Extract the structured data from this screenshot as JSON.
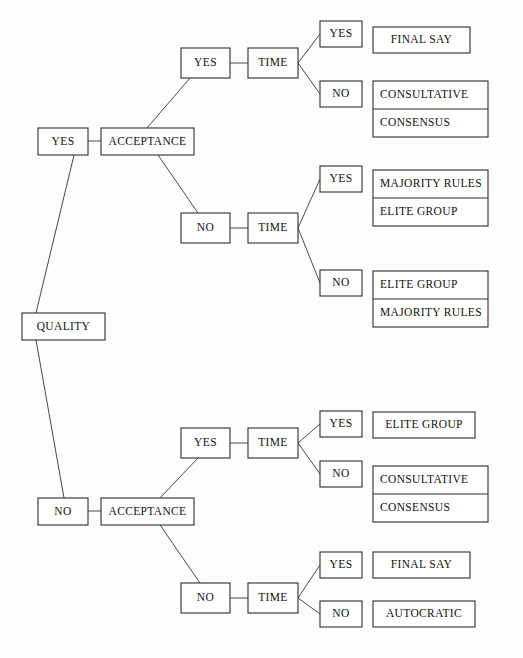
{
  "diagram": {
    "type": "decision-tree",
    "root": "QUALITY",
    "colors": {
      "background": "#fdfdfd",
      "box_stroke": "#2e2e2e",
      "edge_stroke": "#4a4a4a",
      "text": "#111111"
    }
  },
  "nodes": {
    "root": {
      "label": "QUALITY",
      "x": 22,
      "y": 313,
      "w": 83,
      "h": 27,
      "align": "center"
    },
    "q_yes": {
      "label": "YES",
      "x": 38,
      "y": 128,
      "w": 50,
      "h": 27,
      "align": "center"
    },
    "q_no": {
      "label": "NO",
      "x": 38,
      "y": 498,
      "w": 50,
      "h": 27,
      "align": "center"
    },
    "acc_top": {
      "label": "ACCEPTANCE",
      "x": 101,
      "y": 128,
      "w": 93,
      "h": 27,
      "align": "center"
    },
    "acc_bot": {
      "label": "ACCEPTANCE",
      "x": 101,
      "y": 498,
      "w": 93,
      "h": 27,
      "align": "center"
    },
    "acc_top_yes": {
      "label": "YES",
      "x": 181,
      "y": 48,
      "w": 49,
      "h": 30,
      "align": "center"
    },
    "acc_top_no": {
      "label": "NO",
      "x": 181,
      "y": 213,
      "w": 49,
      "h": 30,
      "align": "center"
    },
    "acc_bot_yes": {
      "label": "YES",
      "x": 181,
      "y": 428,
      "w": 49,
      "h": 30,
      "align": "center"
    },
    "acc_bot_no": {
      "label": "NO",
      "x": 181,
      "y": 583,
      "w": 49,
      "h": 30,
      "align": "center"
    },
    "time_1": {
      "label": "TIME",
      "x": 248,
      "y": 48,
      "w": 50,
      "h": 30,
      "align": "center"
    },
    "time_2": {
      "label": "TIME",
      "x": 248,
      "y": 213,
      "w": 50,
      "h": 30,
      "align": "center"
    },
    "time_3": {
      "label": "TIME",
      "x": 248,
      "y": 428,
      "w": 50,
      "h": 30,
      "align": "center"
    },
    "time_4": {
      "label": "TIME",
      "x": 248,
      "y": 583,
      "w": 50,
      "h": 30,
      "align": "center"
    },
    "t1_yes": {
      "label": "YES",
      "x": 320,
      "y": 21,
      "w": 42,
      "h": 26,
      "align": "center"
    },
    "t1_no": {
      "label": "NO",
      "x": 320,
      "y": 81,
      "w": 42,
      "h": 26,
      "align": "center"
    },
    "t2_yes": {
      "label": "YES",
      "x": 320,
      "y": 166,
      "w": 42,
      "h": 26,
      "align": "center"
    },
    "t2_no": {
      "label": "NO",
      "x": 320,
      "y": 270,
      "w": 42,
      "h": 26,
      "align": "center"
    },
    "t3_yes": {
      "label": "YES",
      "x": 320,
      "y": 411,
      "w": 42,
      "h": 26,
      "align": "center"
    },
    "t3_no": {
      "label": "NO",
      "x": 320,
      "y": 461,
      "w": 42,
      "h": 26,
      "align": "center"
    },
    "t4_yes": {
      "label": "YES",
      "x": 320,
      "y": 552,
      "w": 42,
      "h": 26,
      "align": "center"
    },
    "t4_no": {
      "label": "NO",
      "x": 320,
      "y": 601,
      "w": 42,
      "h": 26,
      "align": "center"
    }
  },
  "outcomes": [
    {
      "id": "outcome-final-say-1",
      "items": [
        "FINAL SAY"
      ],
      "x": 373,
      "y": 27,
      "w": 97,
      "h": 26,
      "align": "center"
    },
    {
      "id": "outcome-consultative-consensus-1",
      "items": [
        "CONSULTATIVE",
        "CONSENSUS"
      ],
      "x": 373,
      "y": 81,
      "w": 115,
      "h": 56,
      "align": "left"
    },
    {
      "id": "outcome-majority-elite",
      "items": [
        "MAJORITY RULES",
        "ELITE GROUP"
      ],
      "x": 373,
      "y": 170,
      "w": 115,
      "h": 56,
      "align": "left"
    },
    {
      "id": "outcome-elite-majority",
      "items": [
        "ELITE GROUP",
        "MAJORITY RULES"
      ],
      "x": 373,
      "y": 271,
      "w": 115,
      "h": 56,
      "align": "left"
    },
    {
      "id": "outcome-elite-group-2",
      "items": [
        "ELITE GROUP"
      ],
      "x": 373,
      "y": 412,
      "w": 102,
      "h": 26,
      "align": "center"
    },
    {
      "id": "outcome-consultative-consensus-2",
      "items": [
        "CONSULTATIVE",
        "CONSENSUS"
      ],
      "x": 373,
      "y": 466,
      "w": 115,
      "h": 56,
      "align": "left"
    },
    {
      "id": "outcome-final-say-2",
      "items": [
        "FINAL SAY"
      ],
      "x": 373,
      "y": 552,
      "w": 97,
      "h": 26,
      "align": "center"
    },
    {
      "id": "outcome-autocratic",
      "items": [
        "AUTOCRATIC"
      ],
      "x": 373,
      "y": 601,
      "w": 102,
      "h": 26,
      "align": "center"
    }
  ],
  "edges": [
    {
      "id": "edge-quality-yes",
      "from": "QUALITY",
      "to": "YES",
      "x1": 36,
      "y1": 313,
      "x2": 74,
      "y2": 155
    },
    {
      "id": "edge-quality-no",
      "from": "QUALITY",
      "to": "NO",
      "x1": 36,
      "y1": 340,
      "x2": 64,
      "y2": 498
    },
    {
      "id": "edge-yes-acceptance-top",
      "from": "YES",
      "to": "ACCEPTANCE",
      "x1": 88,
      "y1": 141,
      "x2": 101,
      "y2": 141
    },
    {
      "id": "edge-no-acceptance-bot",
      "from": "NO",
      "to": "ACCEPTANCE",
      "x1": 88,
      "y1": 511,
      "x2": 101,
      "y2": 511
    },
    {
      "id": "edge-acceptance-top-yes",
      "from": "ACCEPTANCE",
      "to": "YES",
      "x1": 147,
      "y1": 128,
      "x2": 190,
      "y2": 78
    },
    {
      "id": "edge-acceptance-top-no",
      "from": "ACCEPTANCE",
      "to": "NO",
      "x1": 158,
      "y1": 155,
      "x2": 198,
      "y2": 213
    },
    {
      "id": "edge-acceptance-bot-yes",
      "from": "ACCEPTANCE",
      "to": "YES",
      "x1": 160,
      "y1": 498,
      "x2": 198,
      "y2": 458
    },
    {
      "id": "edge-acceptance-bot-no",
      "from": "ACCEPTANCE",
      "to": "NO",
      "x1": 160,
      "y1": 525,
      "x2": 200,
      "y2": 583
    },
    {
      "id": "edge-yes-time-1",
      "from": "YES",
      "to": "TIME",
      "x1": 230,
      "y1": 63,
      "x2": 248,
      "y2": 63
    },
    {
      "id": "edge-no-time-2",
      "from": "NO",
      "to": "TIME",
      "x1": 230,
      "y1": 228,
      "x2": 248,
      "y2": 228
    },
    {
      "id": "edge-yes-time-3",
      "from": "YES",
      "to": "TIME",
      "x1": 230,
      "y1": 443,
      "x2": 248,
      "y2": 443
    },
    {
      "id": "edge-no-time-4",
      "from": "NO",
      "to": "TIME",
      "x1": 230,
      "y1": 598,
      "x2": 248,
      "y2": 598
    },
    {
      "id": "edge-time1-yes",
      "from": "TIME",
      "to": "YES",
      "x1": 298,
      "y1": 63,
      "x2": 320,
      "y2": 34
    },
    {
      "id": "edge-time1-no",
      "from": "TIME",
      "to": "NO",
      "x1": 298,
      "y1": 63,
      "x2": 320,
      "y2": 94
    },
    {
      "id": "edge-time2-yes",
      "from": "TIME",
      "to": "YES",
      "x1": 298,
      "y1": 228,
      "x2": 320,
      "y2": 179
    },
    {
      "id": "edge-time2-no",
      "from": "TIME",
      "to": "NO",
      "x1": 298,
      "y1": 228,
      "x2": 320,
      "y2": 283
    },
    {
      "id": "edge-time3-yes",
      "from": "TIME",
      "to": "YES",
      "x1": 298,
      "y1": 443,
      "x2": 320,
      "y2": 424
    },
    {
      "id": "edge-time3-no",
      "from": "TIME",
      "to": "NO",
      "x1": 298,
      "y1": 443,
      "x2": 320,
      "y2": 474
    },
    {
      "id": "edge-time4-yes",
      "from": "TIME",
      "to": "YES",
      "x1": 298,
      "y1": 598,
      "x2": 320,
      "y2": 565
    },
    {
      "id": "edge-time4-no",
      "from": "TIME",
      "to": "NO",
      "x1": 298,
      "y1": 598,
      "x2": 320,
      "y2": 614
    }
  ]
}
